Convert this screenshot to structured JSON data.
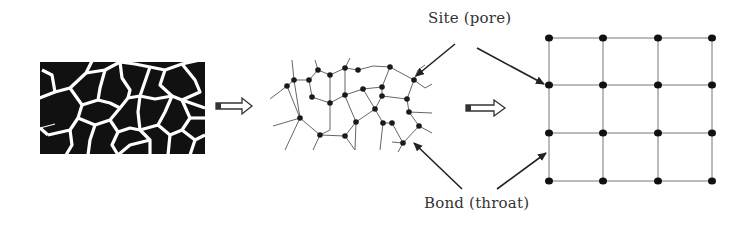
{
  "figure": {
    "panels": [
      {
        "id": "porous-medium",
        "label": "Porous medium (solid grains with pore space)"
      },
      {
        "id": "pore-network",
        "label": "Irregular pore network"
      },
      {
        "id": "square-lattice",
        "label": "Regular 4x4 lattice network"
      }
    ],
    "labels": {
      "site": "Site (pore)",
      "bond": "Bond (throat)"
    },
    "colors": {
      "ink": "#1a1a1a",
      "line": "#555555",
      "background": "#ffffff"
    },
    "lattice": {
      "rows": 4,
      "cols": 4,
      "x": [
        549,
        603,
        658,
        712
      ],
      "y": [
        38,
        85,
        133,
        181
      ]
    }
  }
}
